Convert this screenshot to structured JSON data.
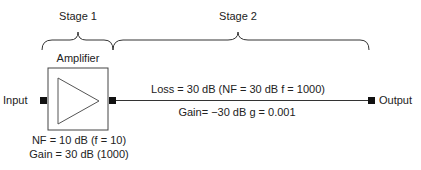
{
  "stages": [
    {
      "label": "Stage 1"
    },
    {
      "label": "Stage 2"
    }
  ],
  "amplifier": {
    "title": "Amplifier",
    "nf_label": "NF = 10 dB (f = 10)",
    "gain_label": "Gain = 30 dB (1000)"
  },
  "ports": {
    "input": "Input",
    "output": "Output"
  },
  "line": {
    "loss_label": "Loss = 30 dB (NF = 30 dB f = 1000)",
    "gain_label": "Gain= −30 dB g = 0.001"
  },
  "colors": {
    "stroke": "#333333",
    "port": "#111111"
  }
}
